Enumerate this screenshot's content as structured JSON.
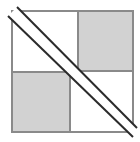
{
  "figure": {
    "title": "",
    "caption": "",
    "canvas": {
      "width": 140,
      "height": 142,
      "background": "#ffffff"
    },
    "colors": {
      "background": "#ffffff",
      "square_fill": "#d2d2d2",
      "square_stroke": "#8a8a8a",
      "outer_stroke": "#8a8a8a",
      "diagonal_stroke": "#2b2b2b",
      "diagonal_highlight": "#ffffff"
    },
    "strokes": {
      "outer_width": 2,
      "square_width": 2,
      "diagonal_width": 2
    },
    "outer_square": {
      "label": "outer-square",
      "x": 12,
      "y": 11,
      "width": 121,
      "height": 121,
      "fill": "none",
      "stroke": "#8a8a8a"
    },
    "shaded_squares": [
      {
        "label": "top-right-shaded-square",
        "position": "top-right",
        "x": 78,
        "y": 11,
        "width": 55,
        "height": 60,
        "fill": "#d2d2d2",
        "stroke": "#8a8a8a"
      },
      {
        "label": "bottom-left-shaded-square",
        "position": "bottom-left",
        "x": 12,
        "y": 72,
        "width": 58,
        "height": 60,
        "fill": "#d2d2d2",
        "stroke": "#8a8a8a"
      }
    ],
    "diagonals": [
      {
        "label": "upper-diagonal-line",
        "x1": 17,
        "y1": 7,
        "x2": 137,
        "y2": 128,
        "stroke": "#2b2b2b",
        "width": 2
      },
      {
        "label": "lower-diagonal-line",
        "x1": 8,
        "y1": 16,
        "x2": 133,
        "y2": 137,
        "stroke": "#2b2b2b",
        "width": 2
      }
    ],
    "diagonal_gap_band": {
      "label": "diagonal-gap-band",
      "points": "17,7 137,128 133,137 8,16",
      "fill": "#ffffff"
    }
  }
}
